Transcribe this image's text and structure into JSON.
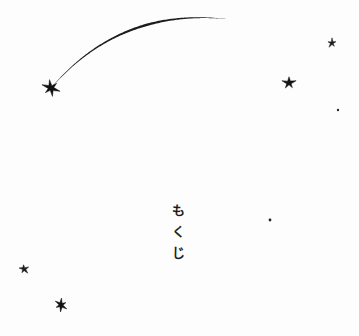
{
  "page": {
    "background_color": "#fdfdfd",
    "ink_color": "#1d1d1d",
    "width": 359,
    "height": 336
  },
  "toc_heading": {
    "full_text": "もくじ",
    "romaji": "mokuji",
    "orientation": "vertical",
    "characters": [
      "も",
      "く",
      "じ"
    ]
  },
  "artwork": {
    "comet": {
      "name": "comet-with-trail",
      "head_x": 51,
      "head_y": 88,
      "tail_tip_x": 226,
      "tail_tip_y": 19,
      "color": "#1d1d1d"
    },
    "stars": [
      {
        "name": "star-comet-head",
        "x": 51,
        "y": 88,
        "size": 17,
        "points": 6,
        "rotation": -10,
        "color": "#111111"
      },
      {
        "name": "star-upper-right",
        "x": 332,
        "y": 43,
        "size": 9,
        "points": 5,
        "rotation": 0,
        "color": "#1d1d1d"
      },
      {
        "name": "star-right-mid",
        "x": 289,
        "y": 83,
        "size": 13,
        "points": 5,
        "rotation": 0,
        "color": "#141414"
      },
      {
        "name": "star-lower-left",
        "x": 24,
        "y": 269,
        "size": 10,
        "points": 5,
        "rotation": -6,
        "color": "#1d1d1d"
      },
      {
        "name": "star-bottom-left",
        "x": 61,
        "y": 305,
        "size": 13,
        "points": 6,
        "rotation": 4,
        "color": "#111111"
      }
    ],
    "dots": [
      {
        "name": "dot-right-upper",
        "x": 338,
        "y": 110,
        "size": 2.4,
        "color": "#2a2a2a"
      },
      {
        "name": "dot-center-right",
        "x": 270,
        "y": 220,
        "size": 2.8,
        "color": "#222222"
      }
    ]
  }
}
